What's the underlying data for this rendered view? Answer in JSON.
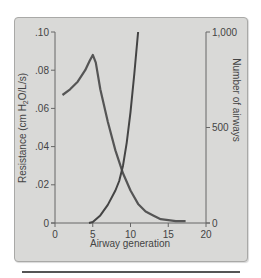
{
  "chart_data": {
    "type": "line",
    "title": "",
    "xlabel": "Airway generation",
    "ylabel": "Resistance (cm H2O/L/s)",
    "ylabel_parts": {
      "pre": "Resistance (cm H",
      "sub": "2",
      "post": "O/L/s)"
    },
    "y2label": "Number of airways",
    "xlim": [
      0,
      20
    ],
    "ylim": [
      0,
      0.1
    ],
    "y2lim": [
      0,
      1000
    ],
    "x_ticks": [
      "0",
      "5",
      "10",
      "15",
      "20"
    ],
    "y_ticks": [
      "0",
      ".02",
      ".04",
      ".06",
      ".08",
      ".10"
    ],
    "y2_ticks": [
      "0",
      "500",
      "1,000"
    ],
    "grid": false,
    "legend": null,
    "series": [
      {
        "name": "Resistance",
        "axis": "left",
        "x": [
          1,
          2,
          3,
          4,
          4.6,
          5,
          5.4,
          6,
          7,
          8,
          9,
          10,
          11,
          12,
          13,
          14,
          15,
          16,
          17.3
        ],
        "y": [
          0.067,
          0.07,
          0.074,
          0.08,
          0.085,
          0.088,
          0.084,
          0.07,
          0.053,
          0.038,
          0.026,
          0.017,
          0.01,
          0.006,
          0.004,
          0.002,
          0.0015,
          0.001,
          0.001
        ]
      },
      {
        "name": "Number of airways",
        "axis": "right",
        "x": [
          4.5,
          5,
          6,
          7,
          8,
          8.5,
          9,
          9.5,
          10,
          10.5,
          11
        ],
        "y": [
          0,
          5,
          40,
          95,
          170,
          220,
          300,
          420,
          580,
          780,
          1000
        ]
      }
    ]
  }
}
